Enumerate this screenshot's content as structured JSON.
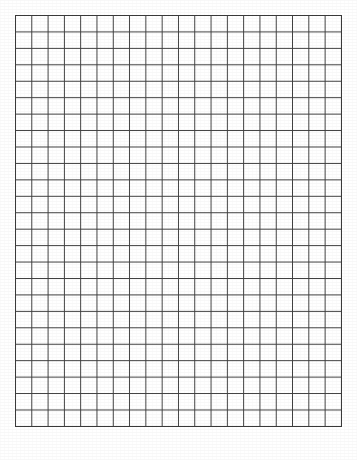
{
  "page": {
    "name": "graph-paper-sheet",
    "width": 357,
    "height": 460,
    "background_color": "#ffffff"
  },
  "grid": {
    "columns": 20,
    "rows": 25,
    "origin_x": 15,
    "origin_y": 15,
    "width": 326,
    "height": 411,
    "cell_width": 16.3,
    "cell_height": 16.44,
    "line_color": "#3d3d3d",
    "line_width": 1.4,
    "border_color": "#3a3a3a",
    "border_width": 1.6,
    "cell_fill_color": "#ffffff"
  },
  "labels": {
    "title": "",
    "caption": "",
    "axis_x": "",
    "axis_y": ""
  },
  "chart_data": {
    "type": "table",
    "title": "",
    "xlabel": "",
    "ylabel": "",
    "grid": true,
    "legend": "none",
    "columns": 20,
    "rows": 25,
    "categories": [],
    "values": []
  }
}
